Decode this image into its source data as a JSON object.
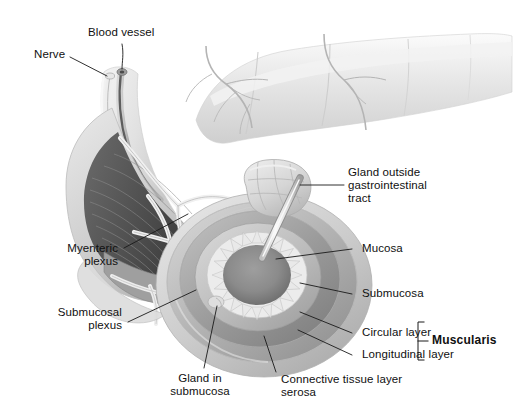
{
  "figure": {
    "background_color": "#ffffff",
    "text_color": "#101010",
    "leader_line_color": "#1a1a1a",
    "width": 529,
    "height": 413
  },
  "labels": {
    "blood_vessel": "Blood vessel",
    "nerve": "Nerve",
    "gland_outside_line1": "Gland outside",
    "gland_outside_line2": "gastrointestinal",
    "gland_outside_line3": "tract",
    "mucosa": "Mucosa",
    "submucosa": "Submucosa",
    "circular_layer": "Circular layer",
    "longitudinal_layer": "Longitudinal layer",
    "muscularis": "Muscularis",
    "myenteric_line1": "Myenteric",
    "myenteric_line2": "plexus",
    "submucosal_plexus_line1": "Submucosal",
    "submucosal_plexus_line2": "plexus",
    "gland_in_submucosa_line1": "Gland in",
    "gland_in_submucosa_line2": "submucosa",
    "connective_line1": "Connective tissue layer",
    "connective_line2": "serosa"
  },
  "art": {
    "lumen_color": "#8d8d8d",
    "mucosa_color": "#e8e8e8",
    "submucosa_color": "#bdbdbd",
    "circular_color": "#9a9a9a",
    "longitudinal_color": "#b4b4b4",
    "serosa_color": "#d2d2d2",
    "gut_tube_color": "#e3e3e3",
    "gland_color": "#d9d9d9",
    "duct_color": "#efefef",
    "mesentery_color": "#ededed"
  }
}
